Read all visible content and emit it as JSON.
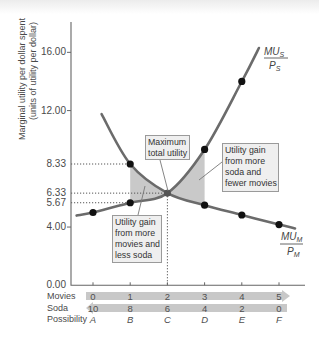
{
  "chart_data": {
    "type": "line",
    "title": "",
    "xlabel": "",
    "ylabel": "Marginal utility per dollar spent (units of utility per dollar)",
    "ylabel_lines": [
      "Marginal utility per dollar spent",
      "(units of utility per dollar)"
    ],
    "ylim": [
      0,
      17.5
    ],
    "grid": false,
    "y_ticks": [
      {
        "value": 16,
        "label": "16.00",
        "tick": true
      },
      {
        "value": 12,
        "label": "12.00",
        "tick": true
      },
      {
        "value": 8.33,
        "label": "8.33",
        "tick": false
      },
      {
        "value": 6.33,
        "label": "6.33",
        "tick": false
      },
      {
        "value": 5.67,
        "label": "5.67",
        "tick": false
      },
      {
        "value": 4,
        "label": "4.00",
        "tick": true
      },
      {
        "value": 0,
        "label": "0.00",
        "tick": false
      }
    ],
    "x": [
      0,
      1,
      2,
      3,
      4,
      5
    ],
    "categories": [
      "A",
      "B",
      "C",
      "D",
      "E",
      "F"
    ],
    "x_rows": [
      {
        "key": "movies",
        "label": "Movies",
        "values": [
          "0",
          "1",
          "2",
          "3",
          "4",
          "5"
        ],
        "arrow": "right",
        "italic": false
      },
      {
        "key": "soda",
        "label": "Soda",
        "values": [
          "10",
          "8",
          "6",
          "4",
          "2",
          "0"
        ],
        "arrow": "left",
        "italic": false
      },
      {
        "key": "possibility",
        "label": "Possibility",
        "values": [
          "A",
          "B",
          "C",
          "D",
          "E",
          "F"
        ],
        "arrow": null,
        "italic": true
      }
    ],
    "series": [
      {
        "name": "MU_S/P_S",
        "num": "MU",
        "num_sub": "S",
        "den": "P",
        "den_sub": "S",
        "values": [
          5.0,
          5.67,
          6.33,
          9.33,
          14.0,
          null
        ],
        "curve": [
          [
            -0.44,
            4.79
          ],
          [
            0,
            5.0
          ],
          [
            1,
            5.67
          ],
          [
            2,
            6.33
          ],
          [
            3,
            9.33
          ],
          [
            4,
            14.0
          ],
          [
            4.46,
            16.3
          ]
        ]
      },
      {
        "name": "MU_M/P_M",
        "num": "MU",
        "num_sub": "M",
        "den": "P",
        "den_sub": "M",
        "values": [
          null,
          8.33,
          6.33,
          5.5,
          4.83,
          4.17
        ],
        "curve": [
          [
            0.23,
            11.76
          ],
          [
            1,
            8.33
          ],
          [
            2,
            6.33
          ],
          [
            3,
            5.5
          ],
          [
            4,
            4.83
          ],
          [
            5,
            4.17
          ],
          [
            5.43,
            3.91
          ]
        ]
      }
    ],
    "guides": [
      {
        "value": 8.33,
        "to_x": 1
      },
      {
        "value": 6.33,
        "to_x": 2
      },
      {
        "value": 5.67,
        "to_x": 1
      }
    ],
    "vertical_guide": {
      "x": 2,
      "from_value": 6.33
    },
    "shaded_regions": [
      {
        "from_x": 1,
        "to_x": 2,
        "upper": "MU_M/P_M",
        "lower": "MU_S/P_S"
      },
      {
        "from_x": 2,
        "to_x": 3,
        "upper": "MU_S/P_S",
        "lower": "MU_M/P_M"
      }
    ],
    "equilibrium": {
      "possibility": "C",
      "index": 2,
      "movies": 2,
      "soda": 6,
      "mu_per_dollar": 6.33
    },
    "annotations": [
      {
        "id": "maximum-total-utility",
        "lines": [
          "Maximum",
          "total utility"
        ]
      },
      {
        "id": "gain-more-soda",
        "lines": [
          "Utility gain",
          "from more",
          "soda and",
          "fewer movies"
        ]
      },
      {
        "id": "gain-more-movies",
        "lines": [
          "Utility gain",
          "from more",
          "movies and",
          "less soda"
        ]
      }
    ],
    "colors": {
      "curve": "#6b6b6b",
      "point": "#111111",
      "equilibrium_point": "#555555",
      "shade": "#c9c9c9",
      "axis": "#666666",
      "guide": "#555555",
      "arrow_band": "#c8c8c8"
    }
  }
}
